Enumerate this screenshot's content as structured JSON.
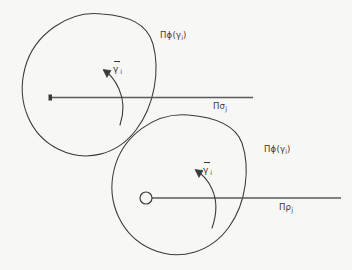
{
  "figure": {
    "background_color": "#f7f7f6",
    "stroke_color": "#3a3a3a",
    "type": "mathematical-diagram"
  },
  "upper_figure": {
    "circle_label": {
      "pi": "Π",
      "phi": "ϕ",
      "open_paren": "(",
      "gamma": "γ",
      "sub": "i",
      "close_paren": ")",
      "full": "Πϕ(γi)"
    },
    "axis_label": {
      "pi": "Π",
      "letter": "σ",
      "sub": "j",
      "full": "Πσj"
    },
    "vector_label": {
      "gamma": "γ",
      "prime": "′",
      "sub": "i",
      "full": "γ̄′i"
    }
  },
  "lower_figure": {
    "circle_label": {
      "pi": "Π",
      "phi": "ϕ",
      "open_paren": "(",
      "gamma": "γ",
      "sub": "i",
      "close_paren": ")",
      "full": "Πϕ(γi)"
    },
    "axis_label": {
      "pi": "Π",
      "letter": "ρ",
      "sub": "j",
      "full": "Πρj"
    },
    "vector_label": {
      "gamma": "γ",
      "prime": "′",
      "sub": "i",
      "full": "γ̄′i"
    }
  }
}
